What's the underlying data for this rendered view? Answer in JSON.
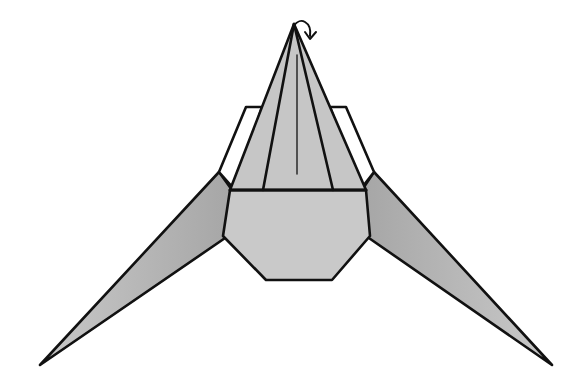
{
  "diagram": {
    "title": "Origami folding step — fold tip behind",
    "colors": {
      "paper": "#c9c9c9",
      "paper_shadow": "#a8a8a8",
      "flap_white": "#ffffff",
      "stroke": "#111111",
      "background": "#ffffff"
    },
    "parts": {
      "arrow": "fold-behind-arrow",
      "top_point": "central pointed layer",
      "flaps": "white side flaps",
      "body": "hexagonal body",
      "wings": "left and right long wings"
    }
  }
}
